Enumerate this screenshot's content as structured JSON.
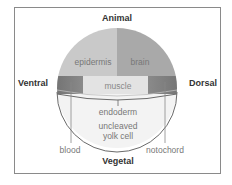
{
  "axes": {
    "animal": "Animal",
    "vegetal": "Vegetal",
    "ventral": "Ventral",
    "dorsal": "Dorsal"
  },
  "regions": {
    "epidermis": "epidermis",
    "brain": "brain",
    "muscle": "muscle",
    "endoderm": "endoderm",
    "yolk_line1": "uncleaved",
    "yolk_line2": "yolk cell",
    "blood": "blood",
    "notochord": "notochord"
  },
  "colors": {
    "epidermis": "#c8c8c8",
    "brain": "#a8a8a8",
    "muscle_band": "#e2e2e2",
    "band_dark": "#7a7a7a",
    "yolk": "#f3f3f3",
    "outline": "#6a6a6a"
  }
}
